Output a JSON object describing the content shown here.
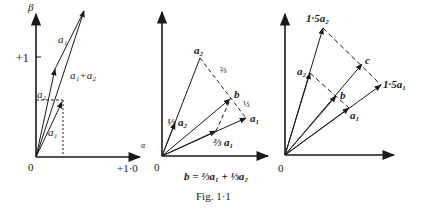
{
  "figure": {
    "caption": "Fig. 1·1",
    "equation": "b = ⅔a₁ + ⅓a₂"
  },
  "panel1": {
    "axis_x_label": "α",
    "axis_y_label": "β",
    "tick_y": "+1",
    "tick_x": "+1·0",
    "origin": "0",
    "labels": {
      "a1_upper": "a₁",
      "sum": "a₁+a₂",
      "a2": "a₂",
      "a1_lower": "a₁"
    }
  },
  "panel2": {
    "origin": "0",
    "labels": {
      "a2": "a₂",
      "two_thirds": "⅔",
      "b": "b",
      "one_third": "⅓",
      "a1": "a₁",
      "third_a2": "⅓ a₂",
      "two_thirds_a1": "⅔ a₁"
    }
  },
  "panel3": {
    "origin": "0",
    "labels": {
      "a2_15": "1·5a₂",
      "a2": "a₂",
      "c": "c",
      "a1_15": "1·5a₁",
      "b": "b",
      "a1": "a₁"
    }
  }
}
